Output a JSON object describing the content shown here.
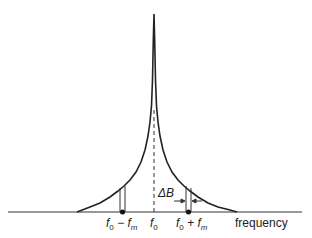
{
  "diagram": {
    "type": "spectrum",
    "labels": {
      "f0_minus_fm": {
        "f": "f",
        "sub0": "0",
        "op": " − ",
        "fm": "f",
        "subm": "m"
      },
      "f0": {
        "f": "f",
        "sub": "0"
      },
      "f0_plus_fm": {
        "f": "f",
        "sub0": "0",
        "op": " + ",
        "fm": "f",
        "subm": "m"
      },
      "delta_b": "ΔB",
      "x_axis": "frequency"
    },
    "colors": {
      "line": "#222222",
      "background": "#ffffff"
    }
  }
}
